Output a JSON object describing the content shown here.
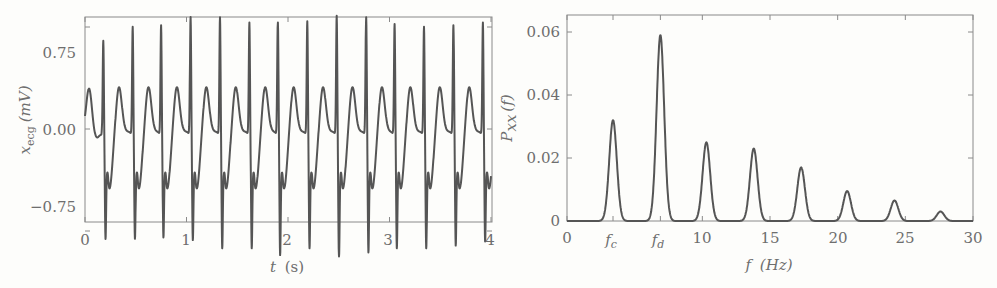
{
  "chart_data": [
    {
      "type": "line",
      "title": "",
      "xlabel": "t (s)",
      "ylabel": "x_ecg (mV)",
      "xlim": [
        0,
        4
      ],
      "ylim": [
        -0.9,
        0.9
      ],
      "xticks": [
        "0",
        "1",
        "2",
        "3",
        "4"
      ],
      "yticks": [
        "0.75",
        "0.00",
        "−0.75"
      ],
      "grid": false,
      "legend": null,
      "series": [
        {
          "name": "ECG",
          "description": "Periodic ECG-like waveform, ~14 beats in 4 s (period ≈0.287 s)",
          "r_peak_times": [
            0.18,
            0.47,
            0.75,
            1.04,
            1.33,
            1.62,
            1.9,
            2.19,
            2.48,
            2.77,
            3.05,
            3.34,
            3.63,
            3.92
          ],
          "r_peak_values": [
            0.68,
            0.78,
            0.79,
            0.85,
            0.85,
            0.81,
            0.81,
            0.82,
            0.86,
            0.85,
            0.8,
            0.78,
            0.79,
            0.81
          ],
          "s_trough_values": [
            -0.65,
            -0.65,
            -0.64,
            -0.66,
            -0.72,
            -0.72,
            -0.77,
            -0.72,
            -0.78,
            -0.75,
            -0.72,
            -0.72,
            -0.7,
            -0.67
          ],
          "t_wave_peak": 0.28,
          "baseline": -0.05
        }
      ]
    },
    {
      "type": "line",
      "title": "",
      "xlabel": "f (Hz)",
      "ylabel": "P_xx (f)",
      "xlim": [
        0,
        30
      ],
      "ylim": [
        0,
        0.065
      ],
      "xticks": [
        "0",
        "f_c",
        "f_d",
        "10",
        "15",
        "20",
        "25",
        "30"
      ],
      "yticks": [
        "0.06",
        "0.04",
        "0.02",
        "0"
      ],
      "grid": false,
      "legend": null,
      "annotations": [
        "f_c",
        "f_d"
      ],
      "series": [
        {
          "name": "Power spectral density",
          "x": [
            3.4,
            6.9,
            10.3,
            13.8,
            17.3,
            20.7,
            24.2,
            27.6
          ],
          "values": [
            0.032,
            0.059,
            0.025,
            0.023,
            0.017,
            0.0095,
            0.0065,
            0.003
          ]
        }
      ]
    }
  ],
  "left": {
    "xticks": [
      "0",
      "1",
      "2",
      "3",
      "4"
    ],
    "yticks": [
      "0.75",
      "0.00",
      "−0.75"
    ],
    "xlabel_var": "t",
    "xlabel_unit": "(s)",
    "ylabel_var": "x",
    "ylabel_sub": "ecg",
    "ylabel_unit": "(mV)"
  },
  "right": {
    "xticks": [
      "0",
      "10",
      "15",
      "20",
      "25",
      "30"
    ],
    "xtick_fc": "f",
    "xtick_fc_sub": "c",
    "xtick_fd": "f",
    "xtick_fd_sub": "d",
    "yticks": [
      "0.06",
      "0.04",
      "0.02",
      "0"
    ],
    "xlabel_var": "f",
    "xlabel_unit": "(Hz)",
    "ylabel_var": "P",
    "ylabel_sub": "xx",
    "ylabel_arg": "(f)"
  },
  "colors": {
    "trace": "#555555",
    "axis": "#8a8a8a",
    "text": "#6e6e6e",
    "background": "#fdfdfb"
  }
}
